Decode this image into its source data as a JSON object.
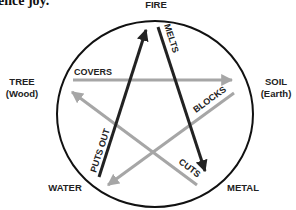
{
  "caption_fragment": "ence joy.",
  "elements": {
    "fire": {
      "name": "FIRE",
      "sub": ""
    },
    "tree": {
      "name": "TREE",
      "sub": "(Wood)"
    },
    "soil": {
      "name": "SOIL",
      "sub": "(Earth)"
    },
    "water": {
      "name": "WATER",
      "sub": ""
    },
    "metal": {
      "name": "METAL",
      "sub": ""
    }
  },
  "relations": {
    "puts_out": {
      "label": "PUTS OUT",
      "from": "WATER",
      "to": "FIRE",
      "color": "#222222"
    },
    "melts": {
      "label": "MELTS",
      "from": "FIRE",
      "to": "METAL",
      "color": "#222222"
    },
    "covers": {
      "label": "COVERS",
      "from": "TREE",
      "to": "SOIL",
      "color": "#a6a6a6"
    },
    "blocks": {
      "label": "BLOCKS",
      "from": "SOIL",
      "to": "WATER",
      "color": "#a6a6a6"
    },
    "cuts": {
      "label": "CUTS",
      "from": "METAL",
      "to": "TREE",
      "color": "#a6a6a6"
    }
  },
  "colors": {
    "dark_arrow": "#222222",
    "light_arrow": "#a6a6a6",
    "circle": "#111111"
  }
}
